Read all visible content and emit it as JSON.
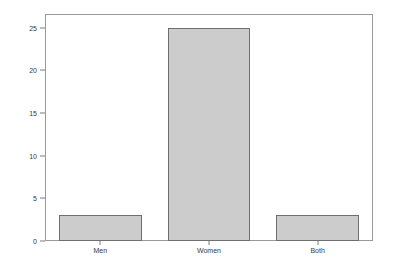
{
  "chart_data": {
    "type": "bar",
    "title": "",
    "subtitle": "",
    "xlabel": "",
    "ylabel": "Frequency",
    "categories": [
      "Men",
      "Women",
      "Both"
    ],
    "values": [
      3,
      25,
      3
    ],
    "series": [
      {
        "name": "Frequency",
        "values": [
          3,
          25,
          3
        ]
      }
    ],
    "ylim": [
      0,
      26.5
    ],
    "y_ticks": [
      0,
      5,
      10,
      15,
      20,
      25
    ],
    "y_tick_labels": [
      "0",
      "5",
      "10",
      "15",
      "20",
      "25"
    ],
    "grid": false,
    "legend": false,
    "legend_position": "none",
    "annotations": [],
    "colors": {
      "bar_fill": "#cccccc",
      "bar_border": "#6f6f6f",
      "frame": "#9a9a9a",
      "text": "#3a3a3a",
      "axis_title": "#2b2b2b",
      "background": "#ffffff"
    }
  }
}
